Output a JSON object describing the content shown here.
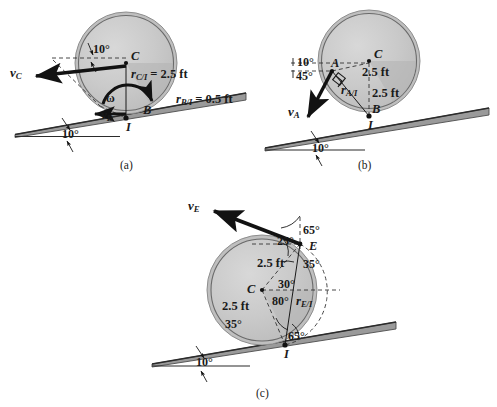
{
  "figure": {
    "type": "mechanics-kinematics-diagram",
    "colors": {
      "wheel_fill": "#c9c9c9",
      "wheel_fill_dark": "#b6b6b6",
      "wheel_edge": "#6e6e6e",
      "incline": "#8a8a8a",
      "ink": "#1a1a1a",
      "dashed": "#444444"
    }
  },
  "panels": [
    {
      "id": "a",
      "caption": "(a)",
      "incline_angle": "10°",
      "points": [
        {
          "name": "C",
          "label": "C"
        },
        {
          "name": "B",
          "label": "B"
        },
        {
          "name": "I",
          "label": "I"
        }
      ],
      "vectors": [
        {
          "name": "v_C",
          "symbol": "v",
          "subscript": "C"
        }
      ],
      "omega_label": "ω",
      "angles": [
        "10°",
        "10°"
      ],
      "dimensions": [
        {
          "symbol": "r",
          "subscript": "C/I",
          "value": "= 2.5 ft",
          "text": "r_C/I = 2.5 ft"
        },
        {
          "symbol": "r",
          "subscript": "B/I",
          "value": "= 0.5 ft",
          "text": "r_B/I = 0.5 ft"
        }
      ]
    },
    {
      "id": "b",
      "caption": "(b)",
      "incline_angle": "10°",
      "points": [
        {
          "name": "C",
          "label": "C"
        },
        {
          "name": "A",
          "label": "A"
        },
        {
          "name": "B",
          "label": "B"
        },
        {
          "name": "I",
          "label": "I"
        }
      ],
      "vectors": [
        {
          "name": "v_A",
          "symbol": "v",
          "subscript": "A"
        }
      ],
      "angles": [
        "10°",
        "45°",
        "10°"
      ],
      "dimensions": [
        {
          "text": "2.5 ft"
        },
        {
          "text": "2.5 ft"
        },
        {
          "symbol": "r",
          "subscript": "A/I",
          "text": "r_A/I"
        }
      ],
      "right_angle_mark": true
    },
    {
      "id": "c",
      "caption": "(c)",
      "incline_angle": "10°",
      "points": [
        {
          "name": "C",
          "label": "C"
        },
        {
          "name": "E",
          "label": "E"
        },
        {
          "name": "I",
          "label": "I"
        }
      ],
      "vectors": [
        {
          "name": "v_E",
          "symbol": "v",
          "subscript": "E"
        }
      ],
      "angles": [
        "65°",
        "25°",
        "35°",
        "30°",
        "80°",
        "35°",
        "65°",
        "10°"
      ],
      "dimensions": [
        {
          "text": "2.5 ft"
        },
        {
          "text": "2.5 ft"
        },
        {
          "symbol": "r",
          "subscript": "E/I",
          "text": "r_E/I"
        }
      ]
    }
  ],
  "labels": {
    "a": {
      "caption": "(a)",
      "C": "C",
      "B": "B",
      "I": "I",
      "vC_v": "v",
      "vC_sub": "C",
      "vB_v": "v",
      "vB_sub": "B",
      "omega": "ω",
      "ang_10_top": "10°",
      "ang_10_incline": "10°",
      "rCI_r": "r",
      "rCI_sub": "C/I",
      "rCI_val": "= 2.5 ft",
      "rBI_r": "r",
      "rBI_sub": "B/I",
      "rBI_val": "= 0.5 ft"
    },
    "b": {
      "caption": "(b)",
      "C": "C",
      "A": "A",
      "B": "B",
      "I": "I",
      "vA_v": "v",
      "vA_sub": "A",
      "ang_10": "10°",
      "ang_45": "45°",
      "ang_10_incline": "10°",
      "dim_25_top": "2.5 ft",
      "dim_25_right": "2.5 ft",
      "rAI_r": "r",
      "rAI_sub": "A/I"
    },
    "c": {
      "caption": "(c)",
      "C": "C",
      "E": "E",
      "I": "I",
      "vE_v": "v",
      "vE_sub": "E",
      "ang_65_top": "65°",
      "ang_25": "25°",
      "ang_35_right": "35°",
      "ang_30": "30°",
      "ang_80": "80°",
      "ang_35_left": "35°",
      "ang_65_bottom": "65°",
      "ang_10_incline": "10°",
      "dim_25_upper": "2.5 ft",
      "dim_25_lower": "2.5 ft",
      "rEI_r": "r",
      "rEI_sub": "E/I"
    }
  }
}
